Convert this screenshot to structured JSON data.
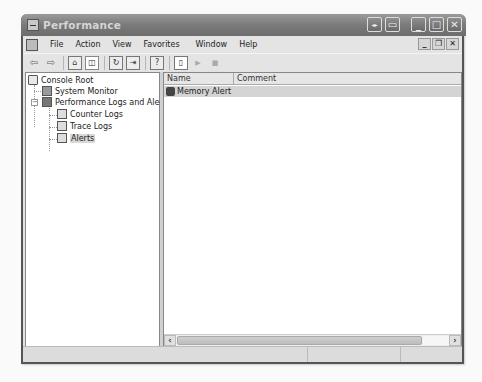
{
  "window": {
    "title": "Performance",
    "title_buttons": [
      "info-icon",
      "window-icon",
      "minimize",
      "maximize",
      "close"
    ],
    "title_button_glyphs": [
      "◂▸",
      "▭",
      "_",
      "□",
      "✕"
    ]
  },
  "menubar": {
    "items": [
      "File",
      "Action",
      "View",
      "Favorites",
      "Window",
      "Help"
    ],
    "mdi_glyphs": [
      "_",
      "❐",
      "✕"
    ]
  },
  "toolbar": {
    "back": "⇦",
    "forward": "⇨",
    "up": "⌂",
    "show_hide_tree": "◫",
    "refresh": "↻",
    "export": "⇥",
    "help": "?",
    "new": "▯",
    "start": "▶",
    "stop": "■"
  },
  "tree": {
    "nodes": [
      {
        "label": "Console Root",
        "level": 0,
        "icon": "folder-icon"
      },
      {
        "label": "System Monitor",
        "level": 1,
        "icon": "monitor-icon"
      },
      {
        "label": "Performance Logs and Alerts",
        "level": 1,
        "icon": "perf-logs-icon",
        "expanded": true,
        "expander": "−"
      },
      {
        "label": "Counter Logs",
        "level": 2,
        "icon": "log-icon"
      },
      {
        "label": "Trace Logs",
        "level": 2,
        "icon": "log-icon"
      },
      {
        "label": "Alerts",
        "level": 2,
        "icon": "alert-icon",
        "selected": true
      }
    ]
  },
  "list": {
    "columns": [
      "Name",
      "Comment"
    ],
    "rows": [
      {
        "name": "Memory Alert",
        "comment": ""
      }
    ]
  },
  "scrollbar": {
    "left_arrow": "‹",
    "right_arrow": "›"
  },
  "statusbar": {
    "segments": [
      "",
      "",
      ""
    ]
  }
}
